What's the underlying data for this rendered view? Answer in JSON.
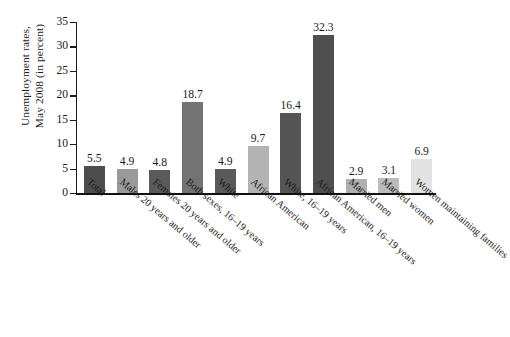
{
  "chart_data": {
    "type": "bar",
    "title": "",
    "xlabel": "",
    "ylabel": "Unemployment rates, May 2008 (in percent)",
    "ylabel_line1": "Unemployment rates,",
    "ylabel_line2": "May 2008 (in percent)",
    "ylim": [
      0,
      35
    ],
    "ytick_step": 5,
    "yticks": [
      "0",
      "5",
      "10",
      "15",
      "20",
      "25",
      "30",
      "35"
    ],
    "grid": false,
    "legend": "none",
    "categories": [
      "Total",
      "Males 20 years and older",
      "Females 20 years and older",
      "Both sexes, 16–19 years",
      "White",
      "African American",
      "White, 16–19 years",
      "African American, 16–19 years",
      "Married men",
      "Married women",
      "Women maintaining families"
    ],
    "values": [
      5.5,
      4.9,
      4.8,
      18.7,
      4.9,
      9.7,
      16.4,
      32.3,
      2.9,
      3.1,
      6.9
    ],
    "value_labels": [
      "5.5",
      "4.9",
      "4.8",
      "18.7",
      "4.9",
      "9.7",
      "16.4",
      "32.3",
      "2.9",
      "3.1",
      "6.9"
    ],
    "bar_colors": [
      "#4d4d4d",
      "#9a9a9a",
      "#5a5a5a",
      "#737373",
      "#5a5a5a",
      "#b3b3b3",
      "#555555",
      "#4f4f4f",
      "#b0b0b0",
      "#bbbbbb",
      "#e2e2e2"
    ],
    "axis_color": "#1a1a1a",
    "background_color": "#ffffff"
  }
}
